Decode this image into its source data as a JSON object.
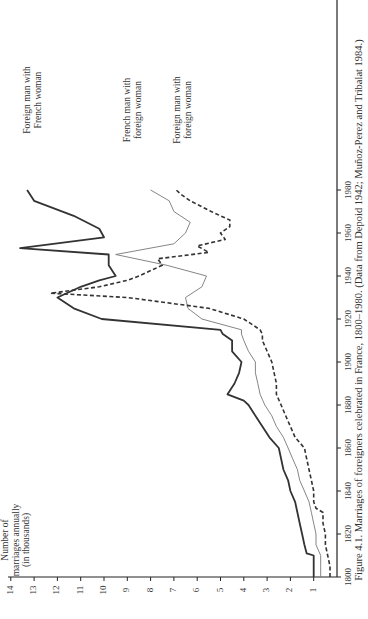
{
  "figure": {
    "caption": "Figure 4.1. Marriages of foreigners celebrated in France, 1800–1980. (Data from Depoid 1942; Muñoz-Perez and Tribalat 1984.)",
    "orientation": "rotated 90° counter-clockwise",
    "ylabel_lines": [
      "Number of",
      "marriages annually",
      "(in thousands)"
    ]
  },
  "chart_data": {
    "type": "line",
    "title": "Marriages of foreigners celebrated in France, 1800–1980",
    "xlabel": "Year",
    "ylabel": "Number of marriages annually (in thousands)",
    "xlim": [
      1800,
      1990
    ],
    "ylim": [
      0,
      14
    ],
    "x_ticks": [
      1800,
      1820,
      1840,
      1860,
      1880,
      1900,
      1920,
      1940,
      1960,
      1980
    ],
    "y_ticks": [
      1,
      2,
      3,
      4,
      5,
      6,
      7,
      8,
      9,
      10,
      11,
      12,
      13,
      14
    ],
    "grid": false,
    "legend": "direct labels at line ends",
    "series": [
      {
        "name": "Foreign man with French woman",
        "style": "solid-thick",
        "color": "#333333",
        "points": [
          [
            1800,
            1.0
          ],
          [
            1805,
            1.0
          ],
          [
            1810,
            1.0
          ],
          [
            1811,
            1.3
          ],
          [
            1815,
            1.4
          ],
          [
            1820,
            1.5
          ],
          [
            1825,
            1.6
          ],
          [
            1830,
            1.7
          ],
          [
            1835,
            1.8
          ],
          [
            1840,
            2.0
          ],
          [
            1845,
            2.1
          ],
          [
            1850,
            2.3
          ],
          [
            1855,
            2.4
          ],
          [
            1860,
            2.5
          ],
          [
            1865,
            2.9
          ],
          [
            1870,
            3.2
          ],
          [
            1875,
            3.5
          ],
          [
            1880,
            3.8
          ],
          [
            1882,
            4.0
          ],
          [
            1885,
            4.7
          ],
          [
            1890,
            4.4
          ],
          [
            1895,
            4.2
          ],
          [
            1900,
            4.1
          ],
          [
            1905,
            4.5
          ],
          [
            1910,
            4.5
          ],
          [
            1913,
            4.9
          ],
          [
            1915,
            5.0
          ],
          [
            1920,
            10.1
          ],
          [
            1925,
            11.3
          ],
          [
            1930,
            12.0
          ],
          [
            1935,
            11.0
          ],
          [
            1938,
            10.2
          ],
          [
            1940,
            9.5
          ],
          [
            1945,
            9.8
          ],
          [
            1950,
            9.8
          ],
          [
            1953,
            13.6
          ],
          [
            1958,
            10.0
          ],
          [
            1962,
            10.2
          ],
          [
            1968,
            11.3
          ],
          [
            1975,
            13.0
          ],
          [
            1980,
            13.3
          ]
        ]
      },
      {
        "name": "French man with foreign woman",
        "style": "solid-thin",
        "color": "#777777",
        "points": [
          [
            1800,
            0.7
          ],
          [
            1805,
            0.7
          ],
          [
            1810,
            0.7
          ],
          [
            1815,
            0.9
          ],
          [
            1820,
            0.9
          ],
          [
            1825,
            1.0
          ],
          [
            1830,
            1.1
          ],
          [
            1835,
            1.2
          ],
          [
            1840,
            1.4
          ],
          [
            1845,
            1.6
          ],
          [
            1850,
            1.7
          ],
          [
            1855,
            1.9
          ],
          [
            1860,
            2.1
          ],
          [
            1865,
            2.3
          ],
          [
            1870,
            2.6
          ],
          [
            1875,
            2.8
          ],
          [
            1880,
            3.1
          ],
          [
            1885,
            3.3
          ],
          [
            1890,
            3.4
          ],
          [
            1895,
            3.5
          ],
          [
            1900,
            3.5
          ],
          [
            1905,
            3.8
          ],
          [
            1910,
            4.0
          ],
          [
            1913,
            4.1
          ],
          [
            1915,
            4.1
          ],
          [
            1920,
            5.8
          ],
          [
            1925,
            6.4
          ],
          [
            1930,
            6.5
          ],
          [
            1935,
            5.8
          ],
          [
            1940,
            5.6
          ],
          [
            1945,
            7.3
          ],
          [
            1950,
            9.5
          ],
          [
            1955,
            7.0
          ],
          [
            1960,
            6.5
          ],
          [
            1965,
            6.3
          ],
          [
            1970,
            7.0
          ],
          [
            1975,
            7.2
          ],
          [
            1980,
            8.0
          ]
        ]
      },
      {
        "name": "Foreign man with foreign woman",
        "style": "dashed",
        "color": "#333333",
        "points": [
          [
            1800,
            0.3
          ],
          [
            1805,
            0.3
          ],
          [
            1810,
            0.4
          ],
          [
            1815,
            0.5
          ],
          [
            1820,
            0.5
          ],
          [
            1825,
            0.6
          ],
          [
            1830,
            0.6
          ],
          [
            1832,
            0.9
          ],
          [
            1835,
            1.0
          ],
          [
            1840,
            1.0
          ],
          [
            1845,
            1.1
          ],
          [
            1850,
            1.2
          ],
          [
            1855,
            1.3
          ],
          [
            1860,
            1.4
          ],
          [
            1865,
            1.8
          ],
          [
            1870,
            2.0
          ],
          [
            1875,
            2.2
          ],
          [
            1880,
            2.4
          ],
          [
            1885,
            2.6
          ],
          [
            1890,
            2.6
          ],
          [
            1895,
            2.7
          ],
          [
            1900,
            2.8
          ],
          [
            1905,
            3.0
          ],
          [
            1910,
            3.2
          ],
          [
            1913,
            3.2
          ],
          [
            1915,
            3.3
          ],
          [
            1920,
            4.0
          ],
          [
            1925,
            5.5
          ],
          [
            1930,
            9.0
          ],
          [
            1932,
            12.3
          ],
          [
            1935,
            10.2
          ],
          [
            1938,
            9.0
          ],
          [
            1940,
            8.5
          ],
          [
            1945,
            7.5
          ],
          [
            1948,
            7.7
          ],
          [
            1951,
            5.5
          ],
          [
            1954,
            6.0
          ],
          [
            1957,
            4.8
          ],
          [
            1960,
            5.0
          ],
          [
            1963,
            4.6
          ],
          [
            1966,
            4.6
          ],
          [
            1970,
            5.4
          ],
          [
            1975,
            6.3
          ],
          [
            1978,
            6.7
          ],
          [
            1980,
            6.9
          ]
        ]
      }
    ]
  }
}
